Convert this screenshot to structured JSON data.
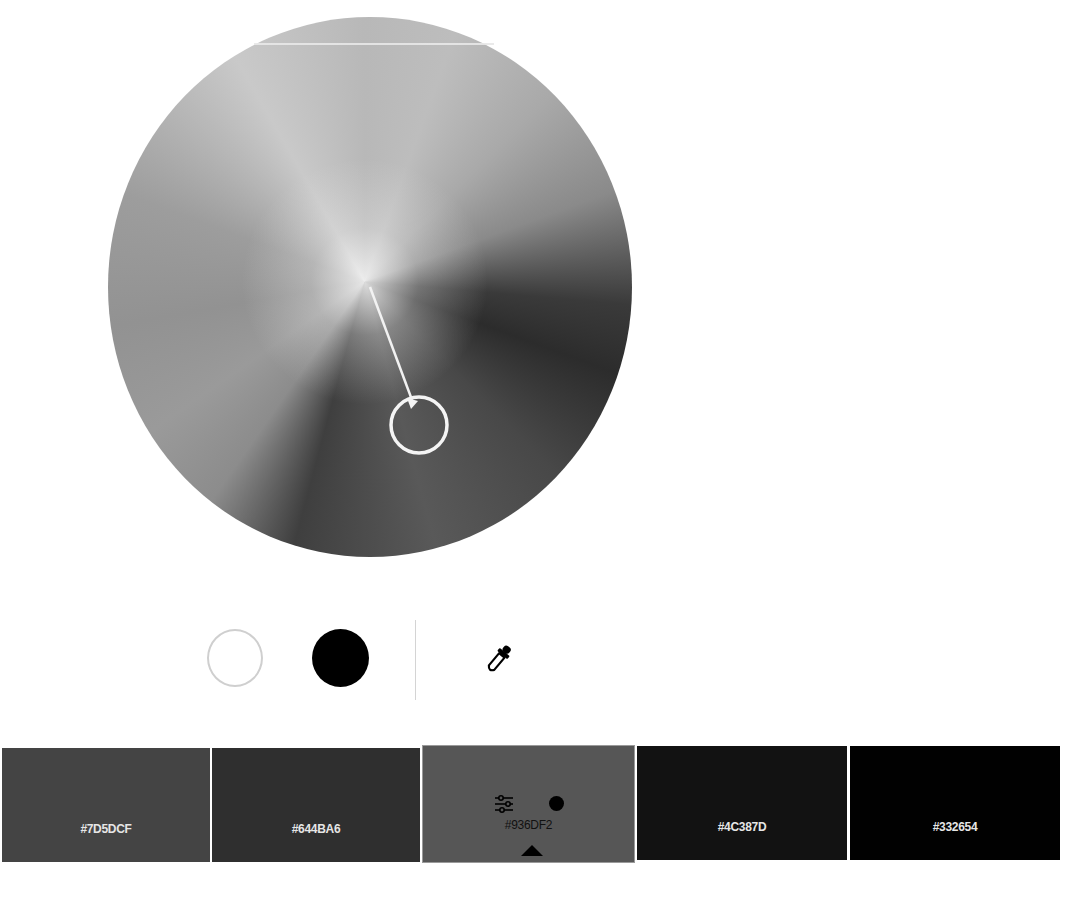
{
  "color_wheel": {
    "label": "color-wheel",
    "handle": {
      "center_x": 311,
      "center_y": 410,
      "radius": 28
    },
    "pivot": {
      "x": 262,
      "y": 270
    }
  },
  "controls": {
    "white_button": "white-preset",
    "black_button": "black-preset",
    "eyedropper": "eyedropper"
  },
  "swatches": [
    {
      "hex": "#7D5DCF",
      "display_color": "#444444",
      "text_color": "#e6e6e6",
      "selected": false
    },
    {
      "hex": "#644BA6",
      "display_color": "#2f2f2f",
      "text_color": "#e6e6e6",
      "selected": false
    },
    {
      "hex": "#936DF2",
      "display_color": "#565656",
      "text_color": "#111111",
      "selected": true
    },
    {
      "hex": "#4C387D",
      "display_color": "#121212",
      "text_color": "#e6e6e6",
      "selected": false
    },
    {
      "hex": "#332654",
      "display_color": "#010101",
      "text_color": "#e6e6e6",
      "selected": false
    }
  ]
}
